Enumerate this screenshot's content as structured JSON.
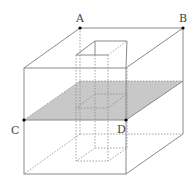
{
  "diagram": {
    "labels": {
      "A": "A",
      "B": "B",
      "C": "C",
      "D": "D"
    },
    "colors": {
      "line": "#8a8a8a",
      "plane": "#c8c8c8",
      "point": "#000000",
      "label": "#444444"
    }
  }
}
